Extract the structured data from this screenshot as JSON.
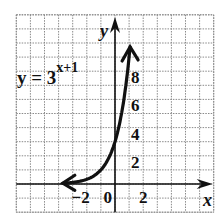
{
  "chart_data": {
    "type": "line",
    "title": "",
    "equation": "y = 3^(x+1)",
    "equation_label": {
      "base": "y = 3",
      "exponent": "x+1"
    },
    "xlabel": "x",
    "ylabel": "y",
    "xlim": [
      -7,
      7
    ],
    "ylim": [
      -2,
      12
    ],
    "grid": true,
    "grid_step": 1,
    "x_tick_labels": [
      {
        "value": -2,
        "text": "−2"
      },
      {
        "value": 0,
        "text": "0"
      },
      {
        "value": 2,
        "text": "2"
      }
    ],
    "y_tick_labels": [
      {
        "value": 2,
        "text": "2"
      },
      {
        "value": 4,
        "text": "4"
      },
      {
        "value": 6,
        "text": "6"
      },
      {
        "value": 8,
        "text": "8"
      }
    ],
    "series": [
      {
        "name": "y = 3^(x+1)",
        "function": "3^(x+1)",
        "x_range": [
          -3.7,
          1.07
        ],
        "arrows": "both",
        "points": [
          {
            "x": -3,
            "y": 0.11
          },
          {
            "x": -2,
            "y": 0.33
          },
          {
            "x": -1,
            "y": 1
          },
          {
            "x": 0,
            "y": 3
          },
          {
            "x": 0.5,
            "y": 5.2
          },
          {
            "x": 1,
            "y": 9
          }
        ]
      }
    ]
  }
}
